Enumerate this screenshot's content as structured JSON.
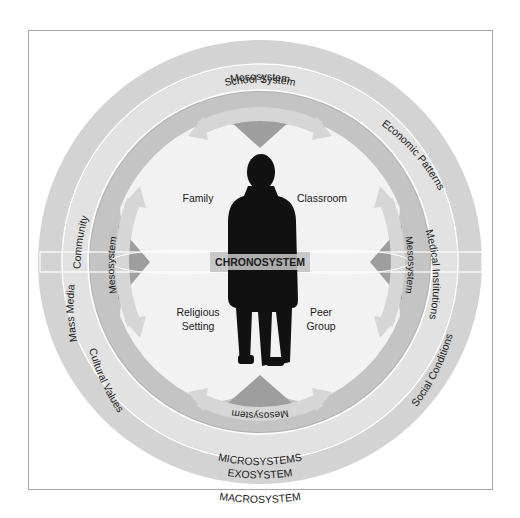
{
  "diagram": {
    "center_label": "CHRONOSYSTEM",
    "rings": {
      "macrosystem": {
        "label": "MACROSYSTEM",
        "items": [
          "Cultural Values",
          "Social Conditions",
          "Economic Patterns"
        ],
        "color": "#d6d6d6"
      },
      "exosystem": {
        "label": "EXOSYSTEM",
        "items": [
          "School System",
          "Community",
          "Mass Media",
          "Medical Institutions"
        ],
        "color": "#e4e4e4"
      },
      "microsystems": {
        "label": "MICROSYSTEMS",
        "color": "#b3b3b3"
      },
      "mesosystem": {
        "label": "Mesosystem",
        "arrows": [
          "top",
          "left",
          "right",
          "bottom"
        ],
        "arrow_color": "#cfcfcf"
      }
    },
    "microsystem_settings": [
      {
        "label": "Family"
      },
      {
        "label": "Classroom"
      },
      {
        "label_line1": "Religious",
        "label_line2": "Setting"
      },
      {
        "label_line1": "Peer",
        "label_line2": "Group"
      }
    ],
    "figure": "person-silhouette"
  }
}
